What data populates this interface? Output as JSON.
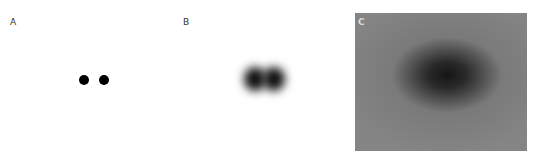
{
  "panels": [
    {
      "label": "A",
      "description": "two sharp black dots"
    },
    {
      "label": "B",
      "description": "two blurred dots merged"
    },
    {
      "label": "C",
      "description": "heavily blurred grey field with dark center"
    }
  ],
  "colors": {
    "background": "#ffffff",
    "dot": "#000000",
    "panel_c_bg": "#8a8a8a",
    "panel_c_center": "#151515"
  }
}
